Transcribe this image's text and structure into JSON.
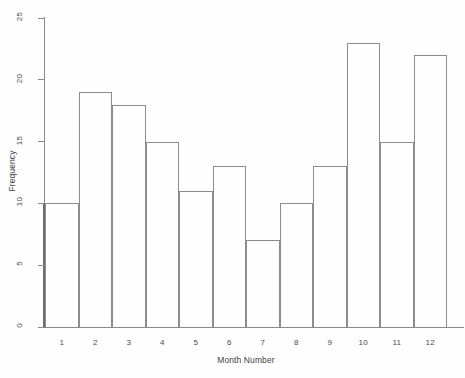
{
  "chart_data": {
    "type": "bar",
    "title": "",
    "xlabel": "Month Number",
    "ylabel": "Frequency",
    "categories": [
      "1",
      "2",
      "3",
      "4",
      "5",
      "6",
      "7",
      "8",
      "9",
      "10",
      "11",
      "12"
    ],
    "values": [
      10,
      19,
      18,
      15,
      11,
      13,
      7,
      10,
      13,
      23,
      15,
      22
    ],
    "series": [
      {
        "name": "Frequency",
        "values": [
          10,
          19,
          18,
          15,
          11,
          13,
          7,
          10,
          13,
          23,
          15,
          22
        ]
      }
    ],
    "xlim": [
      0.5,
      12.5
    ],
    "ylim": [
      0,
      25
    ],
    "yticks": [
      0,
      5,
      10,
      15,
      20,
      25
    ],
    "ytick_labels": [
      "0",
      "5",
      "10",
      "15",
      "20",
      "25"
    ],
    "xtick_labels": [
      "1",
      "2",
      "3",
      "4",
      "5",
      "6",
      "7",
      "8",
      "9",
      "10",
      "11",
      "12"
    ],
    "grid": false,
    "legend": false,
    "legend_position": "none",
    "bar_style": "outlined-contiguous",
    "colors": {
      "background": "#fefefe",
      "axis": "#8c8c8c",
      "bar_edge": "#8c8c8c",
      "bar_fill": "transparent",
      "text": "#4a4a4a"
    }
  }
}
